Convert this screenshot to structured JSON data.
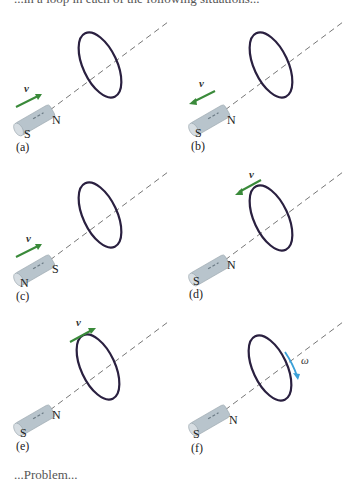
{
  "header_fragment": "...in a loop in each of the following situations...",
  "footer_fragment": "...Problem...",
  "colors": {
    "loop": "#2a2040",
    "axis": "#777777",
    "velocity_arrow": "#3a8a3a",
    "omega_arrow": "#3aa0d8",
    "magnet_body": "#b8c4cc"
  },
  "panels": [
    {
      "id": "a",
      "caption": "(a)",
      "near_pole": "N",
      "far_pole": "S",
      "velocity": {
        "label": "v⃗",
        "direction": "toward loop",
        "position": "near magnet"
      }
    },
    {
      "id": "b",
      "caption": "(b)",
      "near_pole": "N",
      "far_pole": "S",
      "velocity": {
        "label": "v⃗",
        "direction": "away from loop",
        "position": "near magnet"
      }
    },
    {
      "id": "c",
      "caption": "(c)",
      "near_pole": "S",
      "far_pole": "N",
      "velocity": {
        "label": "v⃗",
        "direction": "toward loop",
        "position": "near magnet"
      }
    },
    {
      "id": "d",
      "caption": "(d)",
      "near_pole": "N",
      "far_pole": "S",
      "velocity": {
        "label": "v⃗",
        "direction": "loop toward magnet",
        "position": "above loop"
      }
    },
    {
      "id": "e",
      "caption": "(e)",
      "near_pole": "N",
      "far_pole": "S",
      "velocity": {
        "label": "v⃗",
        "direction": "loop away from magnet",
        "position": "above loop"
      }
    },
    {
      "id": "f",
      "caption": "(f)",
      "near_pole": "N",
      "far_pole": "S",
      "rotation": {
        "label": "ω",
        "position": "on loop right side"
      }
    }
  ]
}
